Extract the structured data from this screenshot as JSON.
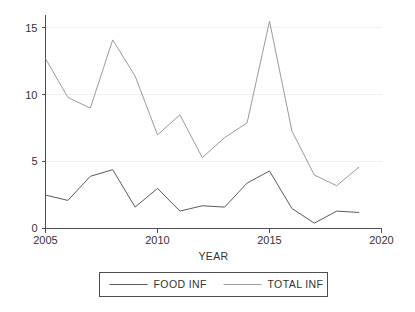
{
  "chart_data": {
    "type": "line",
    "title": "",
    "xlabel": "YEAR",
    "ylabel": "",
    "x": [
      2005,
      2006,
      2007,
      2008,
      2009,
      2010,
      2011,
      2012,
      2013,
      2014,
      2015,
      2016,
      2017,
      2018,
      2019
    ],
    "xlim": [
      2005,
      2020
    ],
    "ylim": [
      0,
      16
    ],
    "xticks": [
      2005,
      2010,
      2015,
      2020
    ],
    "xtick_labels": [
      "2005",
      "2010",
      "2015",
      "2020"
    ],
    "yticks": [
      0,
      5,
      10,
      15
    ],
    "ytick_labels": [
      "0",
      "5",
      "10",
      "15"
    ],
    "grid": true,
    "legend_position": "bottom",
    "series": [
      {
        "name": "FOOD INF",
        "color": "#5a5a5a",
        "values": [
          2.5,
          2.1,
          3.9,
          4.4,
          1.6,
          3.0,
          1.3,
          1.7,
          1.6,
          3.4,
          4.3,
          1.5,
          0.4,
          1.3,
          1.2
        ]
      },
      {
        "name": "TOTAL INF",
        "color": "#9a9a9a",
        "values": [
          12.7,
          9.8,
          9.0,
          14.1,
          11.4,
          7.0,
          8.5,
          5.3,
          6.8,
          7.9,
          15.5,
          7.3,
          4.0,
          3.2,
          4.6
        ]
      }
    ]
  },
  "legend": {
    "items": [
      {
        "label": "FOOD INF"
      },
      {
        "label": "TOTAL INF"
      }
    ]
  },
  "axis": {
    "x_title": "YEAR"
  }
}
